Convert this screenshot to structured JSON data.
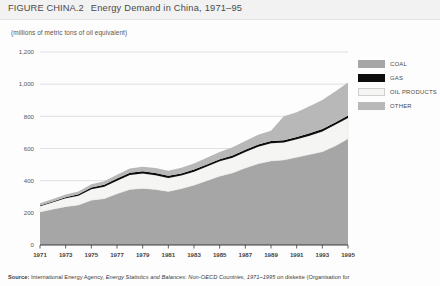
{
  "figure": {
    "label": "FIGURE CHINA.2",
    "title": "Energy Demand  in China, 1971–95",
    "units_note": "(millions of metric tons of oil equivalent)"
  },
  "source": {
    "label": "Source:",
    "text_before": " International Energy Agency, ",
    "italic_text": "Energy Statistics and Balances: Non-OECD Countries, 1971–1995",
    "text_after": " on diskette (Organisation for"
  },
  "legend": {
    "position": "top-right",
    "items": [
      {
        "label": "COAL",
        "color": "#a6a6a6",
        "key": "coal"
      },
      {
        "label": "GAS",
        "color": "#0d0d0d",
        "key": "gas"
      },
      {
        "label": "OIL PRODUCTS",
        "color": "#f5f5f3",
        "key": "oil"
      },
      {
        "label": "OTHER",
        "color": "#b8b8b8",
        "key": "other"
      }
    ]
  },
  "chart_data": {
    "type": "area",
    "stacked": true,
    "title": "Energy Demand  in China, 1971–95",
    "subtitle": "(millions of metric tons of oil equivalent)",
    "xlabel": "",
    "ylabel": "millions of metric tons of oil equivalent",
    "ylim": [
      0,
      1200
    ],
    "yticks": [
      0,
      200,
      400,
      600,
      800,
      1000,
      1200
    ],
    "ytick_labels": [
      "0",
      "200",
      "400",
      "600",
      "800",
      "1,000",
      "1,200"
    ],
    "grid": "horizontal",
    "legend_position": "top-right",
    "x": [
      1971,
      1972,
      1973,
      1974,
      1975,
      1976,
      1977,
      1978,
      1979,
      1980,
      1981,
      1982,
      1983,
      1984,
      1985,
      1986,
      1987,
      1988,
      1989,
      1990,
      1991,
      1992,
      1993,
      1994,
      1995
    ],
    "xticks": [
      1971,
      1973,
      1975,
      1977,
      1979,
      1981,
      1983,
      1985,
      1987,
      1989,
      1991,
      1993,
      1995
    ],
    "xtick_labels": [
      "1971",
      "1973",
      "1975",
      "1977",
      "1979",
      "1981",
      "1983",
      "1985",
      "1987",
      "1989",
      "1991",
      "1993",
      "1995"
    ],
    "series": [
      {
        "name": "COAL",
        "color": "#a6a6a6",
        "values": [
          205,
          222,
          238,
          248,
          278,
          288,
          318,
          345,
          352,
          345,
          332,
          350,
          372,
          400,
          428,
          448,
          478,
          505,
          522,
          528,
          545,
          562,
          580,
          615,
          660
        ]
      },
      {
        "name": "OIL PRODUCTS",
        "color": "#f5f5f3",
        "values": [
          36,
          44,
          52,
          58,
          68,
          74,
          82,
          90,
          92,
          88,
          84,
          82,
          84,
          88,
          92,
          95,
          100,
          106,
          110,
          110,
          112,
          118,
          126,
          132,
          130
        ]
      },
      {
        "name": "GAS",
        "color": "#0d0d0d",
        "values": [
          4,
          5,
          7,
          9,
          11,
          12,
          13,
          14,
          15,
          15,
          14,
          13,
          13,
          13,
          13,
          14,
          14,
          14,
          14,
          14,
          14,
          15,
          15,
          15,
          15
        ]
      },
      {
        "name": "OTHER",
        "color": "#b8b8b8",
        "values": [
          14,
          15,
          17,
          18,
          20,
          22,
          24,
          26,
          28,
          30,
          32,
          35,
          38,
          42,
          46,
          50,
          55,
          60,
          64,
          148,
          155,
          168,
          180,
          192,
          205
        ]
      }
    ],
    "totals": [
      259,
      286,
      314,
      333,
      377,
      396,
      437,
      475,
      487,
      478,
      462,
      480,
      507,
      543,
      579,
      607,
      647,
      685,
      710,
      800,
      826,
      863,
      901,
      954,
      1010
    ]
  }
}
